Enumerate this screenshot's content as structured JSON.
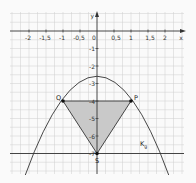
{
  "diagram": {
    "x_axis": {
      "label": "x",
      "ticks": [
        "-2",
        "-1,5",
        "-1",
        "-0,5",
        "0",
        "0,5",
        "1",
        "1,5",
        "2"
      ]
    },
    "y_axis": {
      "label": "y",
      "ticks": [
        "-1",
        "-2",
        "-3",
        "-4",
        "-5",
        "-6",
        "-7"
      ]
    },
    "curve_label": {
      "main": "K",
      "sub": "g"
    },
    "points": {
      "Q": "Q",
      "P": "P",
      "S": "S"
    },
    "curve": "y = -x^2 - 3",
    "horizontal_line": "y = -7",
    "triangle": [
      "Q(-1|-4)",
      "P(1|-4)",
      "S(0|-7)"
    ],
    "colors": {
      "grid": "#c8c8c8",
      "axis": "#333333",
      "fill": "#c9c9c9",
      "background": "#fafafa"
    }
  }
}
